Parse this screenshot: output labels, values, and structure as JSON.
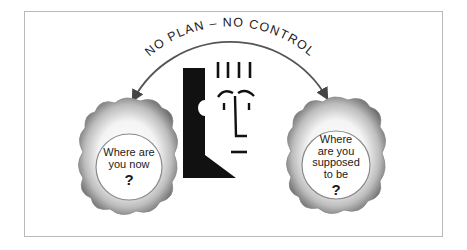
{
  "diagram": {
    "title_arc_text": "NO PLAN – NO CONTROL",
    "left_bubble": {
      "lines": [
        "Where are",
        "you now"
      ],
      "mark": "?"
    },
    "right_bubble": {
      "lines": [
        "Where",
        "are you",
        "supposed",
        "to be"
      ],
      "mark": "?"
    },
    "center_figure": "face-profile-icon",
    "colors": {
      "ink": "#111111",
      "arc": "#555555",
      "frame": "#b9b9b9",
      "cloud_light": "#ffffff",
      "cloud_dark": "#7a7a7a"
    }
  }
}
